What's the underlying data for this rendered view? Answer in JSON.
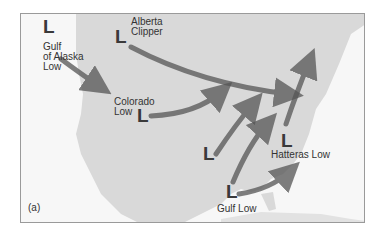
{
  "figure_label": "(a)",
  "storm_tracks": [
    {
      "name": "Gulf of Alaska Low",
      "label_lines": [
        "Gulf",
        "of Alaska",
        "Low"
      ],
      "symbol": "L"
    },
    {
      "name": "Alberta Clipper",
      "label_lines": [
        "Alberta",
        "Clipper"
      ],
      "symbol": "L"
    },
    {
      "name": "Colorado Low",
      "label_lines": [
        "Colorado",
        "Low"
      ],
      "symbol": "L"
    },
    {
      "name": "Unlabeled Low",
      "label_lines": [],
      "symbol": "L"
    },
    {
      "name": "Gulf Low",
      "label_lines": [
        "Gulf Low"
      ],
      "symbol": "L"
    },
    {
      "name": "Hatteras Low",
      "label_lines": [
        "Hatteras Low"
      ],
      "symbol": "L"
    }
  ],
  "colors": {
    "land": "#d9d9d9",
    "water": "#f7f7f7",
    "arrow": "#555555",
    "text": "#333333"
  }
}
